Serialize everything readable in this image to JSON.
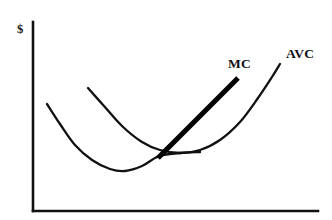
{
  "figure": {
    "title": "",
    "background_color": "#ffffff",
    "ink_color": "#111111",
    "width": 332,
    "height": 220
  },
  "axes": {
    "y_axis_label": "$",
    "x_axis_label": "",
    "y_axis": {
      "x": 33,
      "y_top": 22,
      "y_bottom": 211
    },
    "x_axis": {
      "y": 211,
      "x_left": 33,
      "x_right": 318
    }
  },
  "labels": {
    "mc": "MC",
    "avc": "AVC",
    "dollar": "$"
  },
  "chart_data": {
    "type": "line",
    "title": "",
    "xlabel": "",
    "ylabel": "$",
    "grid": false,
    "legend": "inline-curve-labels",
    "xlim": [
      33,
      318
    ],
    "ylim": [
      211,
      22
    ],
    "series": [
      {
        "name": "lower-cost-curve",
        "label": "",
        "style": "thin-curve",
        "points": [
          [
            47,
            104
          ],
          [
            60,
            124
          ],
          [
            75,
            145
          ],
          [
            92,
            160
          ],
          [
            110,
            169
          ],
          [
            125,
            171
          ],
          [
            142,
            166
          ],
          [
            155,
            158
          ],
          [
            163,
            155
          ],
          [
            180,
            153
          ],
          [
            200,
            152
          ]
        ]
      },
      {
        "name": "AVC",
        "label": "AVC",
        "style": "thin-curve",
        "points": [
          [
            88,
            88
          ],
          [
            104,
            106
          ],
          [
            122,
            126
          ],
          [
            142,
            142
          ],
          [
            160,
            150
          ],
          [
            180,
            153
          ],
          [
            200,
            150
          ],
          [
            220,
            140
          ],
          [
            240,
            122
          ],
          [
            258,
            98
          ],
          [
            272,
            77
          ],
          [
            280,
            64
          ]
        ]
      },
      {
        "name": "MC",
        "label": "MC",
        "style": "thick-line",
        "points": [
          [
            158,
            158
          ],
          [
            238,
            78
          ]
        ]
      }
    ],
    "annotations": [
      {
        "text": "MC",
        "x": 228,
        "y": 68,
        "anchor": "start"
      },
      {
        "text": "AVC",
        "x": 286,
        "y": 58,
        "anchor": "start"
      },
      {
        "text": "$",
        "x": 17,
        "y": 33,
        "anchor": "start"
      }
    ],
    "intersection": {
      "x": 160,
      "y": 155,
      "meaning": "MC crosses AVC at AVC minimum"
    }
  }
}
